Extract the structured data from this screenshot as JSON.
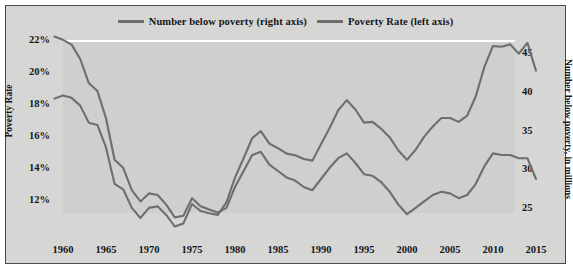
{
  "legend": {
    "items": [
      {
        "label": "Number below poverty (right axis)",
        "color": "#6e6e70",
        "icon": "line-swatch"
      },
      {
        "label": "Poverty Rate (left axis)",
        "color": "#6e6e70",
        "icon": "line-swatch"
      }
    ]
  },
  "axes": {
    "left_title": "Poverty Rate",
    "right_title": "Number below poverty, in millions",
    "left_ticks": [
      "22%",
      "20%",
      "18%",
      "16%",
      "14%",
      "12%"
    ],
    "right_ticks": [
      "45",
      "40",
      "35",
      "30",
      "25"
    ],
    "x_ticks": [
      "1960",
      "1965",
      "1970",
      "1975",
      "1980",
      "1985",
      "1990",
      "1995",
      "2000",
      "2005",
      "2010",
      "2015"
    ]
  },
  "colors": {
    "background": "#d6d6d4",
    "plot_background": "#cfcfcd",
    "line": "#6e6e70",
    "frame": "#4a4a4a",
    "text": "#17171a"
  },
  "chart_data": {
    "type": "line",
    "title": "",
    "xlabel": "",
    "ylabel": "Poverty Rate",
    "y2label": "Number below poverty, in millions",
    "grid": false,
    "legend_position": "top-center",
    "xlim": [
      1959,
      2015
    ],
    "ylim": [
      11,
      23
    ],
    "y2lim": [
      22.5,
      48
    ],
    "x": [
      1959,
      1960,
      1961,
      1962,
      1963,
      1964,
      1965,
      1966,
      1967,
      1968,
      1969,
      1970,
      1971,
      1972,
      1973,
      1974,
      1975,
      1976,
      1977,
      1978,
      1979,
      1980,
      1981,
      1982,
      1983,
      1984,
      1985,
      1986,
      1987,
      1988,
      1989,
      1990,
      1991,
      1992,
      1993,
      1994,
      1995,
      1996,
      1997,
      1998,
      1999,
      2000,
      2001,
      2002,
      2003,
      2004,
      2005,
      2006,
      2007,
      2008,
      2009,
      2010,
      2011,
      2012,
      2013,
      2014,
      2015
    ],
    "series": [
      {
        "name": "Poverty Rate (left axis)",
        "axis": "left",
        "units": "percent",
        "values": [
          22.4,
          22.2,
          21.9,
          21.0,
          19.5,
          19.0,
          17.3,
          14.7,
          14.2,
          12.8,
          12.1,
          12.6,
          12.5,
          11.9,
          11.1,
          11.2,
          12.3,
          11.8,
          11.6,
          11.4,
          11.7,
          13.0,
          14.0,
          15.0,
          15.2,
          14.4,
          14.0,
          13.6,
          13.4,
          13.0,
          12.8,
          13.5,
          14.2,
          14.8,
          15.1,
          14.5,
          13.8,
          13.7,
          13.3,
          12.7,
          11.9,
          11.3,
          11.7,
          12.1,
          12.5,
          12.7,
          12.6,
          12.3,
          12.5,
          13.2,
          14.3,
          15.1,
          15.0,
          15.0,
          14.8,
          14.8,
          13.5
        ]
      },
      {
        "name": "Number below poverty (right axis)",
        "axis": "right",
        "units": "millions",
        "values": [
          39.5,
          39.9,
          39.6,
          38.6,
          36.4,
          36.1,
          33.2,
          28.5,
          27.8,
          25.4,
          24.1,
          25.4,
          25.6,
          24.5,
          23.0,
          23.4,
          25.9,
          25.0,
          24.7,
          24.5,
          26.1,
          29.3,
          31.8,
          34.4,
          35.3,
          33.7,
          33.1,
          32.4,
          32.2,
          31.7,
          31.5,
          33.6,
          35.7,
          38.0,
          39.3,
          38.1,
          36.4,
          36.5,
          35.6,
          34.5,
          32.8,
          31.6,
          32.9,
          34.6,
          35.9,
          37.0,
          37.0,
          36.5,
          37.3,
          39.8,
          43.6,
          46.3,
          46.2,
          46.5,
          45.3,
          46.7,
          43.1
        ]
      }
    ]
  }
}
